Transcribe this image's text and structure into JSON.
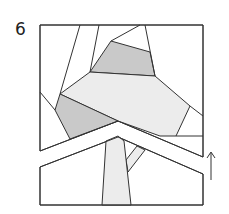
{
  "step": {
    "number": "6"
  },
  "colors": {
    "stroke": "#333333",
    "background": "#ffffff",
    "light_fill": "#ececec",
    "medium_fill": "#c9c9c9",
    "white_fill": "#ffffff"
  },
  "diagram": {
    "arrow": {
      "direction": "up"
    },
    "pieces": [
      {
        "name": "top-grey-piece",
        "fill": "medium"
      },
      {
        "name": "center-light-piece",
        "fill": "light"
      },
      {
        "name": "left-grey-piece",
        "fill": "medium"
      },
      {
        "name": "trunk-piece",
        "fill": "light"
      },
      {
        "name": "branch-piece",
        "fill": "light"
      },
      {
        "name": "chevron-strip",
        "fill": "white"
      }
    ]
  }
}
